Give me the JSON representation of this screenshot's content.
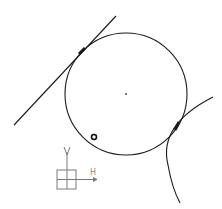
{
  "sketch": {
    "background": "#ffffff",
    "stroke_color": "#1a1a1a",
    "axis_color": "#7a7a7a",
    "main_circle": {
      "cx": 126,
      "cy": 94,
      "r": 61
    },
    "center_point": {
      "x": 126,
      "y": 94
    },
    "tangent_line": {
      "x1": 14,
      "y1": 125,
      "x2": 116,
      "y2": 16
    },
    "tangent_point_line": {
      "x": 82,
      "y": 51
    },
    "tangent_point_arc": {
      "x": 177,
      "y": 126
    },
    "adjacent_arc": {
      "path": "M 213 97 Q 158 125 168 165 Q 172 188 180 203"
    },
    "small_circle_marker": {
      "cx": 94,
      "cy": 137,
      "r": 2.5
    },
    "coordinate_system": {
      "vertical_label": "V",
      "horizontal_label": "H",
      "origin": {
        "x": 67,
        "y": 179
      }
    }
  }
}
